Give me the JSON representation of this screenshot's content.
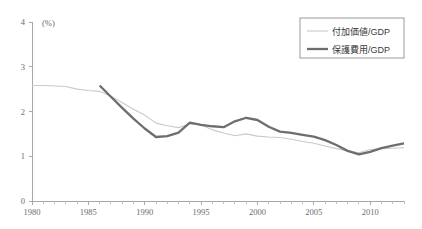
{
  "chart_data": {
    "type": "line",
    "title": "",
    "xlabel": "",
    "ylabel": "",
    "unit_label": "(%)",
    "xlim": [
      1980,
      2013
    ],
    "ylim": [
      0,
      4
    ],
    "yticks": [
      0,
      1,
      2,
      3,
      4
    ],
    "ytick_labels": [
      "0",
      "1",
      "2",
      "3",
      "4"
    ],
    "xticks": [
      1980,
      1985,
      1990,
      1995,
      2000,
      2005,
      2010
    ],
    "xtick_labels": [
      "1980",
      "1985",
      "1990",
      "1995",
      "2000",
      "2005",
      "2010"
    ],
    "minor_tick_interval": 1,
    "grid": false,
    "legend_position": "top-right",
    "series": [
      {
        "name": "付加価値/GDP",
        "color": "#c9c9c9",
        "width": 1.1,
        "x": [
          1980,
          1981,
          1982,
          1983,
          1984,
          1985,
          1986,
          1987,
          1988,
          1989,
          1990,
          1991,
          1992,
          1993,
          1994,
          1995,
          1996,
          1997,
          1998,
          1999,
          2000,
          2001,
          2002,
          2003,
          2004,
          2005,
          2006,
          2007,
          2008,
          2009,
          2010,
          2011,
          2012,
          2013
        ],
        "values": [
          2.58,
          2.58,
          2.57,
          2.56,
          2.5,
          2.47,
          2.45,
          2.34,
          2.2,
          2.05,
          1.92,
          1.74,
          1.68,
          1.64,
          1.72,
          1.7,
          1.59,
          1.52,
          1.46,
          1.5,
          1.45,
          1.43,
          1.42,
          1.38,
          1.33,
          1.29,
          1.23,
          1.17,
          1.12,
          1.08,
          1.15,
          1.17,
          1.18,
          1.19
        ]
      },
      {
        "name": "保護費用/GDP",
        "color": "#6e6e6e",
        "width": 2.3,
        "x": [
          1986,
          1987,
          1988,
          1989,
          1990,
          1991,
          1992,
          1993,
          1994,
          1995,
          1996,
          1997,
          1998,
          1999,
          2000,
          2001,
          2002,
          2003,
          2004,
          2005,
          2006,
          2007,
          2008,
          2009,
          2010,
          2011,
          2012,
          2013
        ],
        "values": [
          2.58,
          2.33,
          2.08,
          1.84,
          1.62,
          1.43,
          1.45,
          1.53,
          1.75,
          1.7,
          1.67,
          1.65,
          1.78,
          1.86,
          1.81,
          1.66,
          1.55,
          1.52,
          1.48,
          1.44,
          1.36,
          1.25,
          1.12,
          1.04,
          1.1,
          1.18,
          1.24,
          1.29
        ]
      }
    ]
  },
  "legend": {
    "items": [
      {
        "label": "付加価値/GDP",
        "swatch": "light-line-swatch"
      },
      {
        "label": "保護費用/GDP",
        "swatch": "dark-line-swatch"
      }
    ]
  },
  "colors": {
    "series_light": "#c9c9c9",
    "series_dark": "#6e6e6e",
    "axis": "#a8a8a8",
    "text": "#6b6b6b",
    "background": "#ffffff"
  }
}
